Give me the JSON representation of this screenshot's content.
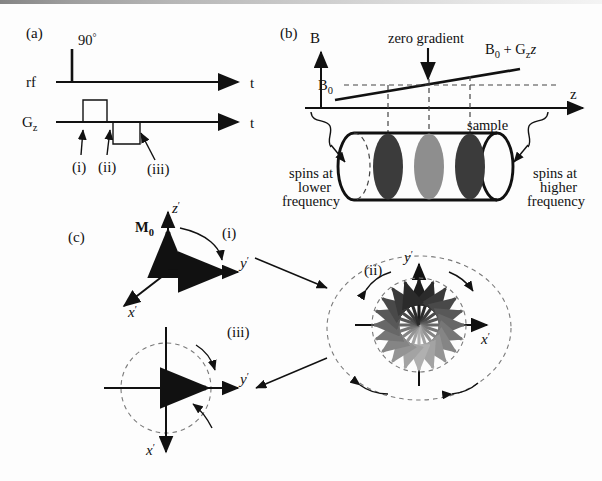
{
  "figure": {
    "domain_note": "NMR/MRI gradient refocusing (gradient echo) schematic",
    "panels": [
      {
        "id": "a",
        "label": "(a)"
      },
      {
        "id": "b",
        "label": "(b)"
      },
      {
        "id": "c",
        "label": "(c)"
      }
    ]
  },
  "panel_a": {
    "label": "(a)",
    "rf_axis_label": "rf",
    "gz_axis_label": "G",
    "gz_axis_sub": "z",
    "time_axis_label_rf": "t",
    "time_axis_label_gz": "t",
    "pulse_label": "90",
    "pulse_label_degree": "°",
    "markers": [
      {
        "label": "(i)"
      },
      {
        "label": "(ii)"
      },
      {
        "label": "(iii)"
      }
    ]
  },
  "panel_b": {
    "label": "(b)",
    "y_axis_label": "B",
    "x_axis_label": "z",
    "b0_label": "B",
    "b0_label_sub": "0",
    "zero_gradient_label": "zero gradient",
    "gradient_line_label_b0": "B",
    "gradient_line_label_b0_sub": "0",
    "gradient_line_label_plus": " + G",
    "gradient_line_label_gsub": "z",
    "gradient_line_label_z": "z",
    "sample_label": "sample",
    "left_annotation_lines": [
      "spins at",
      "lower",
      "frequency"
    ],
    "right_annotation_lines": [
      "spins at",
      "higher",
      "frequency"
    ],
    "slices": [
      {
        "shade": "#3b3b3b"
      },
      {
        "shade": "#8e8e8e"
      },
      {
        "shade": "#3b3b3b"
      }
    ]
  },
  "panel_c": {
    "label": "(c)",
    "step_i": {
      "label": "(i)",
      "magnetization_label": "M",
      "magnetization_sub": "0",
      "axis_z": "z",
      "axis_z_prime": "′",
      "axis_y": "y",
      "axis_y_prime": "′",
      "axis_x": "x",
      "axis_x_prime": "′"
    },
    "step_ii": {
      "label": "(ii)",
      "axis_y": "y",
      "axis_y_prime": "′",
      "axis_x": "x",
      "axis_x_prime": "′",
      "fan_arrow_count": 20,
      "fan_shades": [
        "#1d1d1d",
        "#2b2b2b",
        "#3a3a3a",
        "#494949",
        "#585858",
        "#676767",
        "#767676",
        "#858585",
        "#949494",
        "#a3a3a3",
        "#b0b0b0",
        "#a3a3a3",
        "#949494",
        "#858585",
        "#767676",
        "#676767",
        "#585858",
        "#494949",
        "#3a3a3a",
        "#2b2b2b"
      ]
    },
    "step_iii": {
      "label": "(iii)",
      "axis_y": "y",
      "axis_y_prime": "′",
      "axis_x": "x",
      "axis_x_prime": "′"
    }
  },
  "colors": {
    "ink": "#111111",
    "dash": "#444444",
    "slice_dark": "#3b3b3b",
    "slice_light": "#8e8e8e",
    "background": "#fdfdfd"
  }
}
